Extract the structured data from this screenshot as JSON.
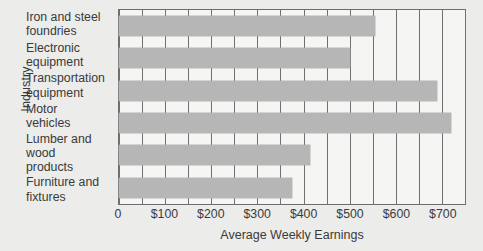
{
  "chart_data": {
    "type": "bar",
    "orientation": "horizontal",
    "title": "",
    "xlabel": "Average Weekly Earnings",
    "ylabel": "Industry",
    "categories": [
      "Iron and steel\nfoundries",
      "Electronic\nequipment",
      "Transportation\nequipment",
      "Motor\nvehicles",
      "Lumber and wood\nproducts",
      "Furniture and\nfixtures"
    ],
    "values": [
      555,
      500,
      690,
      720,
      415,
      375
    ],
    "xlim": [
      0,
      750
    ],
    "ylim": [
      0,
      6
    ],
    "grid": true,
    "grid_axis": "x",
    "grid_interval": 50,
    "legend": null,
    "tick_labels": [
      "0",
      "$100",
      "$200",
      "$300",
      "$400",
      "$500",
      "$600",
      "$700"
    ],
    "tick_values": [
      0,
      100,
      200,
      300,
      400,
      500,
      600,
      700
    ],
    "bar_color": "#b6b6b6",
    "plot_background": "#f5f5f4",
    "figure_background": "#ececeb",
    "axis_color": "#6e6e6e"
  }
}
